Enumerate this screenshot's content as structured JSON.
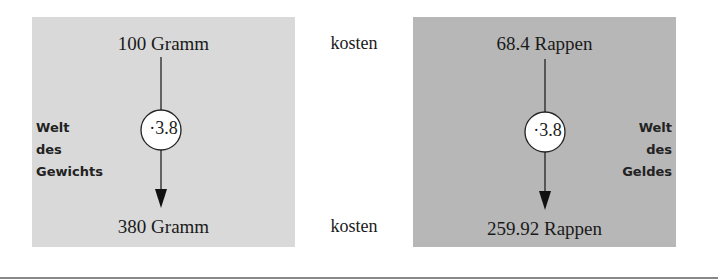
{
  "left_panel": {
    "title": "Welt des Gewichts",
    "side_label": [
      "Welt",
      "des",
      "Gewichts"
    ],
    "top_value": "100 Gramm",
    "factor": "·3.8",
    "bottom_value": "380 Gramm",
    "background": "#d9d9d9"
  },
  "middle": {
    "top_word": "kosten",
    "bottom_word": "kosten"
  },
  "right_panel": {
    "title": "Welt des Geldes",
    "side_label": [
      "Welt",
      "des",
      "Geldes"
    ],
    "top_value": "68.4 Rappen",
    "factor": "·3.8",
    "bottom_value": "259.92 Rappen",
    "background": "#b7b7b7"
  }
}
